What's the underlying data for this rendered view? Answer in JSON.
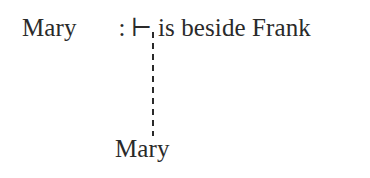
{
  "diagram": {
    "type": "sequent-derivation",
    "background_color": "#ffffff",
    "text_color": "#2a2a2a",
    "top_line": {
      "subject": "Mary",
      "separator": ":",
      "turnstile": "⊢",
      "predicate": "is beside Frank"
    },
    "connector": {
      "style": "dashed",
      "orientation": "vertical",
      "color": "#2a2a2a",
      "dash_length": 6,
      "gap_length": 5
    },
    "bottom_line": {
      "label": "Mary"
    }
  }
}
